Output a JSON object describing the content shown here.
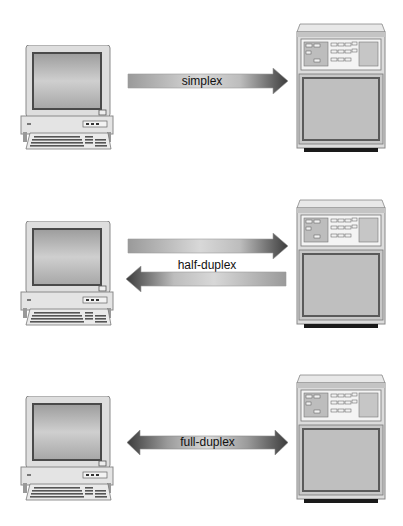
{
  "diagram": {
    "colors": {
      "background": "#ffffff",
      "arrow_light": "#d4d4d4",
      "arrow_dark": "#4a4a4a",
      "device_body": "#dcdcdc",
      "screen": "#b8b8b8",
      "foot": "#1a1a1a"
    },
    "rows": [
      {
        "mode": "simplex",
        "label": "simplex",
        "left_device": "terminal-computer",
        "right_device": "mainframe-server",
        "arrows": [
          {
            "direction": "right"
          }
        ]
      },
      {
        "mode": "half-duplex",
        "label": "half-duplex",
        "left_device": "terminal-computer",
        "right_device": "mainframe-server",
        "arrows": [
          {
            "direction": "right"
          },
          {
            "direction": "left"
          }
        ]
      },
      {
        "mode": "full-duplex",
        "label": "full-duplex",
        "left_device": "terminal-computer",
        "right_device": "mainframe-server",
        "arrows": [
          {
            "direction": "both"
          }
        ]
      }
    ]
  }
}
